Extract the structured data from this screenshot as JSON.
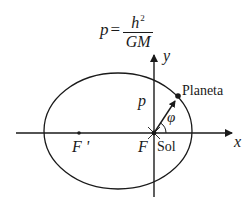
{
  "formula": {
    "lhs": "p",
    "equals": "=",
    "numerator": "h",
    "numerator_exponent": "2",
    "denominator": "GM"
  },
  "labels": {
    "y_axis": "y",
    "x_axis": "x",
    "semi_latus_rectum": "p",
    "planet": "Planeta",
    "angle": "φ",
    "focus_empty": "F '",
    "focus_sun": "F",
    "sun": "Sol"
  },
  "colors": {
    "stroke": "#1a1a1a",
    "background": "#ffffff"
  }
}
